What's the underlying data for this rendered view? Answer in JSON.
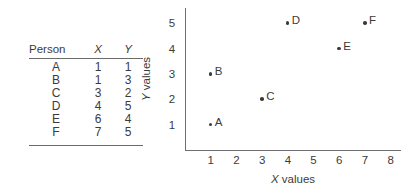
{
  "figure": {
    "text_color": "#3b3b3b",
    "axis_color": "#6f6f6f",
    "background": "#ffffff"
  },
  "table": {
    "name": "person-xy-table",
    "headers": [
      "Person",
      "X",
      "Y"
    ],
    "rows": [
      {
        "person": "A",
        "x": "1",
        "y": "1"
      },
      {
        "person": "B",
        "x": "1",
        "y": "3"
      },
      {
        "person": "C",
        "x": "3",
        "y": "2"
      },
      {
        "person": "D",
        "x": "4",
        "y": "5"
      },
      {
        "person": "E",
        "x": "6",
        "y": "4"
      },
      {
        "person": "F",
        "x": "7",
        "y": "5"
      }
    ]
  },
  "chart_data": {
    "type": "scatter",
    "title": "",
    "xlabel": "X values",
    "ylabel": "Y values",
    "xlabel_var": "X",
    "xlabel_rest": " values",
    "ylabel_var": "Y",
    "ylabel_rest": " values",
    "xlim": [
      0,
      8.4
    ],
    "ylim": [
      0,
      5.6
    ],
    "xticks": [
      "1",
      "2",
      "3",
      "4",
      "5",
      "6",
      "7",
      "8"
    ],
    "yticks": [
      "1",
      "2",
      "3",
      "4",
      "5"
    ],
    "grid": false,
    "legend": false,
    "point_labels": [
      "A",
      "B",
      "C",
      "D",
      "E",
      "F"
    ],
    "x": [
      1,
      1,
      3,
      4,
      6,
      7
    ],
    "y": [
      1,
      3,
      2,
      5,
      4,
      5
    ],
    "points": [
      {
        "label": "A",
        "x": 1,
        "y": 1
      },
      {
        "label": "B",
        "x": 1,
        "y": 3
      },
      {
        "label": "C",
        "x": 3,
        "y": 2
      },
      {
        "label": "D",
        "x": 4,
        "y": 5
      },
      {
        "label": "E",
        "x": 6,
        "y": 4
      },
      {
        "label": "F",
        "x": 7,
        "y": 5
      }
    ]
  }
}
